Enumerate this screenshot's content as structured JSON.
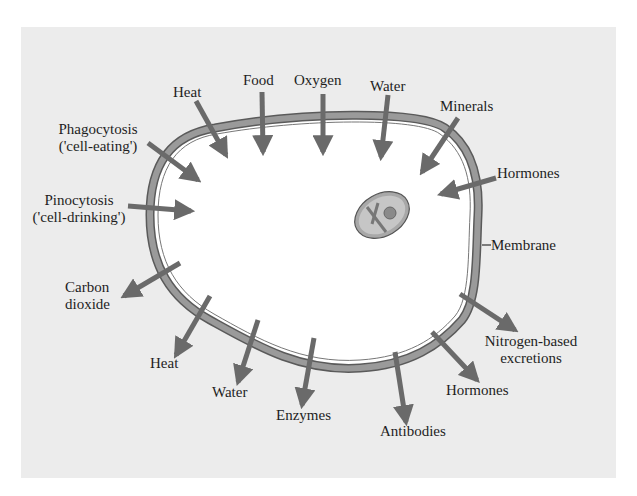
{
  "diagram": {
    "colors": {
      "background": "#ececec",
      "cell_interior": "#ffffff",
      "membrane": "#8f8f8f",
      "membrane_outline": "#5a5a5a",
      "arrow": "#6a6a6a",
      "nucleus": "#b8b8b8",
      "text": "#1e1e1e"
    },
    "inputs": [
      {
        "label": "Heat"
      },
      {
        "label": "Food"
      },
      {
        "label": "Oxygen"
      },
      {
        "label": "Water"
      },
      {
        "label": "Minerals"
      },
      {
        "label": "Hormones"
      },
      {
        "label_line1": "Phagocytosis",
        "label_line2": "('cell-eating')"
      },
      {
        "label_line1": "Pinocytosis",
        "label_line2": "('cell-drinking')"
      }
    ],
    "outputs": [
      {
        "label_line1": "Carbon",
        "label_line2": "dioxide"
      },
      {
        "label": "Heat"
      },
      {
        "label": "Water"
      },
      {
        "label": "Enzymes"
      },
      {
        "label": "Antibodies"
      },
      {
        "label": "Hormones"
      },
      {
        "label_line1": "Nitrogen-based",
        "label_line2": "excretions"
      }
    ],
    "structures": {
      "membrane_label": "Membrane",
      "nucleus": "nucleus"
    }
  }
}
